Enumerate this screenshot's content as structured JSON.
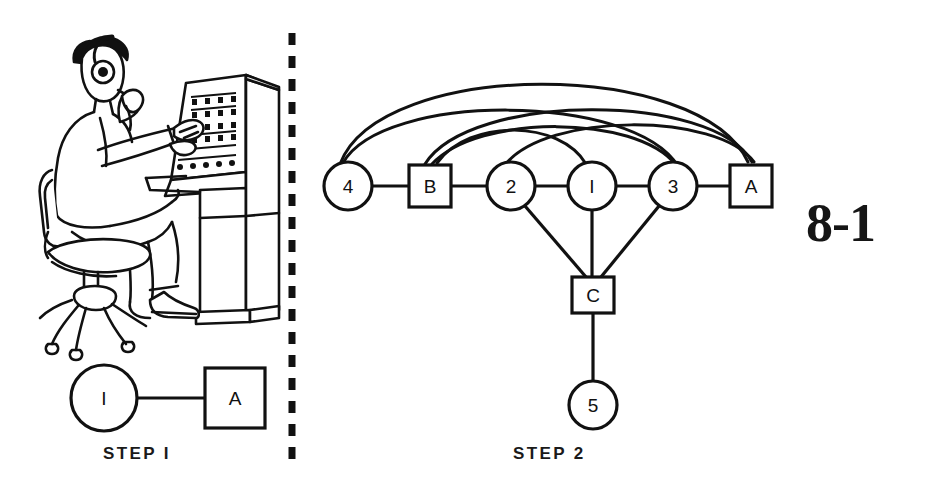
{
  "figure": {
    "number": "8-1",
    "panels": [
      {
        "id": "step1",
        "label": "STEP I"
      },
      {
        "id": "step2",
        "label": "STEP 2"
      }
    ]
  },
  "illustration": {
    "name": "operator-at-console",
    "description": "Line drawing of a seated operator wearing a headset, facing a control console with rows of switches and indicator lights"
  },
  "divider": {
    "name": "dashed-vertical-divider",
    "style": "dashed"
  },
  "step1": {
    "label": "STEP I",
    "nodes": [
      {
        "id": "s1-1",
        "label": "I",
        "shape": "circle",
        "cx": 104,
        "cy": 398,
        "r": 33
      },
      {
        "id": "s1-A",
        "label": "A",
        "shape": "square",
        "x": 205,
        "y": 368,
        "w": 60,
        "h": 60
      }
    ],
    "links": [
      {
        "from": "s1-1",
        "to": "s1-A"
      }
    ]
  },
  "step2": {
    "label": "STEP 2",
    "nodes": [
      {
        "id": "s2-4",
        "label": "4",
        "shape": "circle",
        "cx": 348,
        "cy": 186,
        "r": 24
      },
      {
        "id": "s2-B",
        "label": "B",
        "shape": "square",
        "x": 409,
        "y": 165,
        "w": 42,
        "h": 42
      },
      {
        "id": "s2-2",
        "label": "2",
        "shape": "circle",
        "cx": 511,
        "cy": 186,
        "r": 24
      },
      {
        "id": "s2-1",
        "label": "I",
        "shape": "circle",
        "cx": 592,
        "cy": 186,
        "r": 24
      },
      {
        "id": "s2-3",
        "label": "3",
        "shape": "circle",
        "cx": 673,
        "cy": 186,
        "r": 24
      },
      {
        "id": "s2-A",
        "label": "A",
        "shape": "square",
        "x": 730,
        "y": 165,
        "w": 42,
        "h": 42
      },
      {
        "id": "s2-C",
        "label": "C",
        "shape": "square",
        "x": 572,
        "y": 277,
        "w": 42,
        "h": 36
      },
      {
        "id": "s2-5",
        "label": "5",
        "shape": "circle",
        "cx": 593,
        "cy": 405,
        "r": 24
      }
    ],
    "straight_links": [
      {
        "from": "s2-4",
        "to": "s2-B"
      },
      {
        "from": "s2-B",
        "to": "s2-2"
      },
      {
        "from": "s2-2",
        "to": "s2-1"
      },
      {
        "from": "s2-1",
        "to": "s2-3"
      },
      {
        "from": "s2-3",
        "to": "s2-A"
      },
      {
        "from": "s2-2",
        "to": "s2-C"
      },
      {
        "from": "s2-1",
        "to": "s2-C"
      },
      {
        "from": "s2-3",
        "to": "s2-C"
      },
      {
        "from": "s2-C",
        "to": "s2-5"
      }
    ],
    "arc_links": [
      {
        "from": "s2-4",
        "to": "s2-A",
        "height": "tall"
      },
      {
        "from": "s2-4",
        "to": "s2-3",
        "height": "medium"
      },
      {
        "from": "s2-B",
        "to": "s2-A",
        "height": "medium"
      },
      {
        "from": "s2-B",
        "to": "s2-3",
        "height": "low"
      },
      {
        "from": "s2-2",
        "to": "s2-A",
        "height": "low"
      },
      {
        "from": "s2-1",
        "to": "s2-B",
        "height": "low"
      }
    ]
  },
  "colors": {
    "ink": "#111111",
    "background": "#ffffff"
  }
}
